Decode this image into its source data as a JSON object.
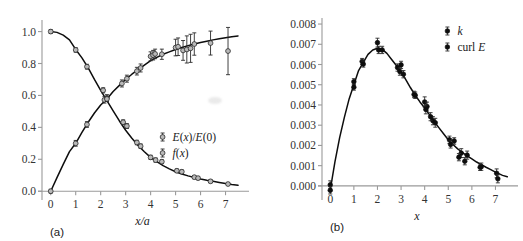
{
  "figure": {
    "panel_a_label": "(a)",
    "panel_b_label": "(b)"
  },
  "chart_data": [
    {
      "type": "scatter",
      "panel": "(a)",
      "title": "",
      "xlabel": "x/a",
      "ylabel": "",
      "xlim": [
        -0.35,
        7.7
      ],
      "ylim": [
        -0.03,
        1.06
      ],
      "xticks": [
        0,
        1,
        2,
        3,
        4,
        5,
        6,
        7
      ],
      "xtick_labels": [
        "0",
        "1",
        "2",
        "3",
        "4",
        "5",
        "6",
        "7"
      ],
      "yticks": [
        0.0,
        0.2,
        0.4,
        0.6,
        0.8,
        1.0
      ],
      "ytick_labels": [
        "0.0",
        "0.2",
        "0.4",
        "0.6",
        "0.8",
        "1.0"
      ],
      "grid": false,
      "legend_position": "center-right",
      "legend": [
        "E(x)/E(0)",
        "f(x)"
      ],
      "series": [
        {
          "name": "f(x)",
          "marker": "open-circle",
          "curve_note": "rising saturating curve from 0 to ~1",
          "curve": [
            [
              0.0,
              0.0
            ],
            [
              0.25,
              0.085
            ],
            [
              0.5,
              0.168
            ],
            [
              0.75,
              0.248
            ],
            [
              1.0,
              0.3
            ],
            [
              1.25,
              0.368
            ],
            [
              1.5,
              0.432
            ],
            [
              1.75,
              0.49
            ],
            [
              2.0,
              0.54
            ],
            [
              2.25,
              0.578
            ],
            [
              2.5,
              0.625
            ],
            [
              2.75,
              0.663
            ],
            [
              3.0,
              0.7
            ],
            [
              3.25,
              0.733
            ],
            [
              3.5,
              0.762
            ],
            [
              3.75,
              0.79
            ],
            [
              4.0,
              0.818
            ],
            [
              4.25,
              0.838
            ],
            [
              4.5,
              0.858
            ],
            [
              4.75,
              0.873
            ],
            [
              5.0,
              0.888
            ],
            [
              5.25,
              0.9
            ],
            [
              5.5,
              0.912
            ],
            [
              5.75,
              0.922
            ],
            [
              6.0,
              0.932
            ],
            [
              6.25,
              0.94
            ],
            [
              6.5,
              0.948
            ],
            [
              6.75,
              0.955
            ],
            [
              7.0,
              0.962
            ],
            [
              7.25,
              0.968
            ],
            [
              7.5,
              0.973
            ]
          ],
          "points": [
            {
              "x": 0.0,
              "y": 0.0,
              "err": 0.012
            },
            {
              "x": 1.0,
              "y": 0.3,
              "err": 0.018
            },
            {
              "x": 1.45,
              "y": 0.418,
              "err": 0.018
            },
            {
              "x": 2.15,
              "y": 0.572,
              "err": 0.02
            },
            {
              "x": 2.25,
              "y": 0.585,
              "err": 0.02
            },
            {
              "x": 2.85,
              "y": 0.675,
              "err": 0.022
            },
            {
              "x": 3.05,
              "y": 0.705,
              "err": 0.022
            },
            {
              "x": 3.45,
              "y": 0.752,
              "err": 0.024
            },
            {
              "x": 3.6,
              "y": 0.772,
              "err": 0.025
            },
            {
              "x": 4.0,
              "y": 0.845,
              "err": 0.028
            },
            {
              "x": 4.1,
              "y": 0.852,
              "err": 0.03
            },
            {
              "x": 4.18,
              "y": 0.86,
              "err": 0.03
            },
            {
              "x": 4.45,
              "y": 0.858,
              "err": 0.032
            },
            {
              "x": 5.0,
              "y": 0.9,
              "err": 0.052
            },
            {
              "x": 5.1,
              "y": 0.905,
              "err": 0.055
            },
            {
              "x": 5.3,
              "y": 0.882,
              "err": 0.062
            },
            {
              "x": 5.45,
              "y": 0.888,
              "err": 0.085
            },
            {
              "x": 5.6,
              "y": 0.895,
              "err": 0.088
            },
            {
              "x": 5.75,
              "y": 0.922,
              "err": 0.07
            },
            {
              "x": 6.4,
              "y": 0.928,
              "err": 0.075
            },
            {
              "x": 7.1,
              "y": 0.878,
              "err": 0.148
            }
          ]
        },
        {
          "name": "E(x)/E(0)",
          "marker": "open-circle",
          "curve_note": "decaying curve from 1 toward 0",
          "curve": [
            [
              0.0,
              1.0
            ],
            [
              0.25,
              0.995
            ],
            [
              0.5,
              0.978
            ],
            [
              0.75,
              0.948
            ],
            [
              1.0,
              0.888
            ],
            [
              1.25,
              0.835
            ],
            [
              1.5,
              0.772
            ],
            [
              1.75,
              0.7
            ],
            [
              2.0,
              0.632
            ],
            [
              2.25,
              0.568
            ],
            [
              2.5,
              0.503
            ],
            [
              2.75,
              0.44
            ],
            [
              3.0,
              0.382
            ],
            [
              3.25,
              0.332
            ],
            [
              3.5,
              0.287
            ],
            [
              3.75,
              0.247
            ],
            [
              4.0,
              0.212
            ],
            [
              4.25,
              0.185
            ],
            [
              4.5,
              0.16
            ],
            [
              4.75,
              0.14
            ],
            [
              5.0,
              0.122
            ],
            [
              5.25,
              0.108
            ],
            [
              5.5,
              0.096
            ],
            [
              5.75,
              0.086
            ],
            [
              6.0,
              0.077
            ],
            [
              6.25,
              0.069
            ],
            [
              6.5,
              0.062
            ],
            [
              6.75,
              0.055
            ],
            [
              7.0,
              0.048
            ],
            [
              7.25,
              0.042
            ],
            [
              7.5,
              0.037
            ]
          ],
          "points": [
            {
              "x": 0.0,
              "y": 1.0,
              "err": 0.012
            },
            {
              "x": 1.0,
              "y": 0.885,
              "err": 0.014
            },
            {
              "x": 1.45,
              "y": 0.78,
              "err": 0.015
            },
            {
              "x": 2.1,
              "y": 0.632,
              "err": 0.016
            },
            {
              "x": 2.25,
              "y": 0.578,
              "err": 0.016
            },
            {
              "x": 2.9,
              "y": 0.432,
              "err": 0.015
            },
            {
              "x": 3.05,
              "y": 0.408,
              "err": 0.015
            },
            {
              "x": 3.45,
              "y": 0.305,
              "err": 0.014
            },
            {
              "x": 3.6,
              "y": 0.282,
              "err": 0.014
            },
            {
              "x": 4.0,
              "y": 0.212,
              "err": 0.013
            },
            {
              "x": 4.2,
              "y": 0.195,
              "err": 0.013
            },
            {
              "x": 4.45,
              "y": 0.185,
              "err": 0.012
            },
            {
              "x": 5.05,
              "y": 0.128,
              "err": 0.011
            },
            {
              "x": 5.25,
              "y": 0.122,
              "err": 0.011
            },
            {
              "x": 5.75,
              "y": 0.088,
              "err": 0.01
            },
            {
              "x": 5.9,
              "y": 0.082,
              "err": 0.01
            },
            {
              "x": 6.4,
              "y": 0.062,
              "err": 0.009
            },
            {
              "x": 7.1,
              "y": 0.045,
              "err": 0.009
            }
          ]
        }
      ]
    },
    {
      "type": "scatter",
      "panel": "(b)",
      "title": "",
      "xlabel": "x",
      "ylabel": "",
      "xlim": [
        -0.35,
        7.7
      ],
      "ylim": [
        -0.0005,
        0.0082
      ],
      "xticks": [
        0,
        1,
        2,
        3,
        4,
        5,
        6,
        7
      ],
      "xtick_labels": [
        "0",
        "1",
        "2",
        "3",
        "4",
        "5",
        "6",
        "7"
      ],
      "yticks": [
        0.0,
        0.001,
        0.002,
        0.003,
        0.004,
        0.005,
        0.006,
        0.007,
        0.008
      ],
      "ytick_labels": [
        "0.000",
        "0.001",
        "0.002",
        "0.003",
        "0.004",
        "0.005",
        "0.006",
        "0.007",
        "0.008"
      ],
      "grid": false,
      "legend_position": "top-right",
      "legend": [
        "k",
        "curl E"
      ],
      "series": [
        {
          "name": "k",
          "marker": "filled-circle",
          "curve_note": "single peaked curve, maximum ~0.0068 near x=2",
          "curve": [
            [
              0.0,
              -0.0002
            ],
            [
              0.2,
              0.0012
            ],
            [
              0.4,
              0.0024
            ],
            [
              0.6,
              0.0034
            ],
            [
              0.8,
              0.0043
            ],
            [
              1.0,
              0.005
            ],
            [
              1.2,
              0.0057
            ],
            [
              1.4,
              0.0061
            ],
            [
              1.6,
              0.0065
            ],
            [
              1.8,
              0.00672
            ],
            [
              2.0,
              0.0068
            ],
            [
              2.2,
              0.00675
            ],
            [
              2.4,
              0.00655
            ],
            [
              2.6,
              0.00625
            ],
            [
              2.8,
              0.00595
            ],
            [
              3.0,
              0.00565
            ],
            [
              3.2,
              0.00525
            ],
            [
              3.4,
              0.00485
            ],
            [
              3.6,
              0.00448
            ],
            [
              3.8,
              0.00415
            ],
            [
              4.0,
              0.00385
            ],
            [
              4.2,
              0.00352
            ],
            [
              4.4,
              0.00318
            ],
            [
              4.6,
              0.00288
            ],
            [
              4.8,
              0.00258
            ],
            [
              5.0,
              0.00228
            ],
            [
              5.2,
              0.00205
            ],
            [
              5.4,
              0.00183
            ],
            [
              5.6,
              0.00165
            ],
            [
              5.8,
              0.00148
            ],
            [
              6.0,
              0.00133
            ],
            [
              6.2,
              0.00118
            ],
            [
              6.4,
              0.00105
            ],
            [
              6.6,
              0.00092
            ],
            [
              6.8,
              0.0008
            ],
            [
              7.0,
              0.00068
            ],
            [
              7.3,
              0.00052
            ],
            [
              7.5,
              0.00045
            ]
          ],
          "points": [
            {
              "x": 0.0,
              "y": 5e-05,
              "err": 0.0002
            },
            {
              "x": 1.0,
              "y": 0.00515,
              "err": 0.00015
            },
            {
              "x": 1.35,
              "y": 0.00615,
              "err": 0.00015
            },
            {
              "x": 2.0,
              "y": 0.00708,
              "err": 0.00022
            },
            {
              "x": 2.85,
              "y": 0.00585,
              "err": 0.00018
            },
            {
              "x": 3.0,
              "y": 0.00598,
              "err": 0.00018
            },
            {
              "x": 3.55,
              "y": 0.00452,
              "err": 0.00016
            },
            {
              "x": 4.0,
              "y": 0.00415,
              "err": 0.00025
            },
            {
              "x": 4.1,
              "y": 0.00392,
              "err": 0.00022
            },
            {
              "x": 4.35,
              "y": 0.00322,
              "err": 0.0002
            },
            {
              "x": 5.05,
              "y": 0.00228,
              "err": 0.00018
            },
            {
              "x": 5.55,
              "y": 0.00162,
              "err": 0.00022
            },
            {
              "x": 5.8,
              "y": 0.00152,
              "err": 0.0002
            },
            {
              "x": 6.4,
              "y": 0.00095,
              "err": 0.00018
            },
            {
              "x": 7.05,
              "y": 0.00062,
              "err": 0.00022
            }
          ]
        },
        {
          "name": "curl E",
          "marker": "filled-circle",
          "points": [
            {
              "x": 0.0,
              "y": -0.00022,
              "err": 0.00018
            },
            {
              "x": 1.0,
              "y": 0.00488,
              "err": 0.00015
            },
            {
              "x": 1.4,
              "y": 0.00602,
              "err": 0.00015
            },
            {
              "x": 2.05,
              "y": 0.00672,
              "err": 0.00018
            },
            {
              "x": 2.2,
              "y": 0.00672,
              "err": 0.00018
            },
            {
              "x": 2.95,
              "y": 0.00565,
              "err": 0.00018
            },
            {
              "x": 3.1,
              "y": 0.00552,
              "err": 0.00018
            },
            {
              "x": 3.6,
              "y": 0.00448,
              "err": 0.00016
            },
            {
              "x": 4.05,
              "y": 0.00378,
              "err": 0.00022
            },
            {
              "x": 4.25,
              "y": 0.00342,
              "err": 0.0002
            },
            {
              "x": 4.45,
              "y": 0.00312,
              "err": 0.00022
            },
            {
              "x": 5.1,
              "y": 0.00205,
              "err": 0.00018
            },
            {
              "x": 5.25,
              "y": 0.00222,
              "err": 0.00016
            },
            {
              "x": 5.45,
              "y": 0.00142,
              "err": 0.00018
            },
            {
              "x": 5.7,
              "y": 0.00122,
              "err": 0.00018
            },
            {
              "x": 6.35,
              "y": 0.00092,
              "err": 0.00016
            },
            {
              "x": 7.1,
              "y": 0.00035,
              "err": 0.0002
            }
          ]
        }
      ]
    }
  ]
}
